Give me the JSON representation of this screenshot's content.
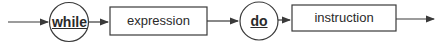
{
  "diagram": {
    "type": "syntax-railroad",
    "nodes": [
      {
        "id": "while",
        "kind": "keyword-circle",
        "label": "while"
      },
      {
        "id": "expression",
        "kind": "nonterminal-box",
        "label": "expression"
      },
      {
        "id": "do",
        "kind": "keyword-circle",
        "label": "do"
      },
      {
        "id": "instruction",
        "kind": "nonterminal-box",
        "label": "instruction"
      }
    ],
    "edges": [
      {
        "from": "start",
        "to": "while"
      },
      {
        "from": "while",
        "to": "expression"
      },
      {
        "from": "expression",
        "to": "do"
      },
      {
        "from": "do",
        "to": "instruction"
      },
      {
        "from": "instruction",
        "to": "end"
      }
    ],
    "colors": {
      "stroke": "#3a3a3a",
      "text": "#2a2a2a",
      "background": "#ffffff"
    }
  }
}
